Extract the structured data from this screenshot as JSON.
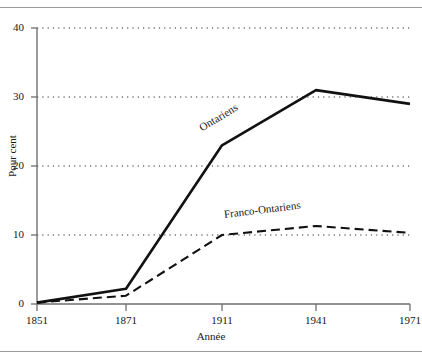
{
  "chart_data": {
    "type": "line",
    "title": "",
    "xlabel": "Année",
    "ylabel": "Pour cent",
    "x": [
      1851,
      1871,
      1911,
      1941,
      1971
    ],
    "xtick_labels": [
      "1851",
      "1871",
      "1911",
      "1941",
      "1971"
    ],
    "ytick_labels": [
      "0",
      "10",
      "20",
      "30",
      "40"
    ],
    "ytick_values": [
      0,
      10,
      20,
      30,
      40
    ],
    "ylim": [
      0,
      40
    ],
    "xlim": [
      1851,
      1971
    ],
    "grid": "horizontal-dotted",
    "legend": "inline-series-labels",
    "series": [
      {
        "name": "Ontariens",
        "style": "solid",
        "values": [
          0.2,
          2.2,
          23.0,
          31.0,
          29.0
        ]
      },
      {
        "name": "Franco-Ontariens",
        "style": "dashed",
        "values": [
          0.2,
          1.2,
          10.0,
          11.3,
          10.3
        ]
      }
    ]
  },
  "axes": {
    "y_title": "Pour cent",
    "x_title": "Année",
    "y_ticks": [
      "40",
      "30",
      "20",
      "10",
      "0"
    ],
    "x_ticks": [
      "1851",
      "1871",
      "1911",
      "1941",
      "1971"
    ]
  },
  "series_labels": {
    "ontariens": "Ontariens",
    "franco_ontariens": "Franco-Ontariens"
  },
  "colors": {
    "line": "#111111",
    "grid": "#2b2b2b",
    "axis": "#6f6f6f",
    "rule": "#9a9a9a",
    "text": "#161616"
  }
}
